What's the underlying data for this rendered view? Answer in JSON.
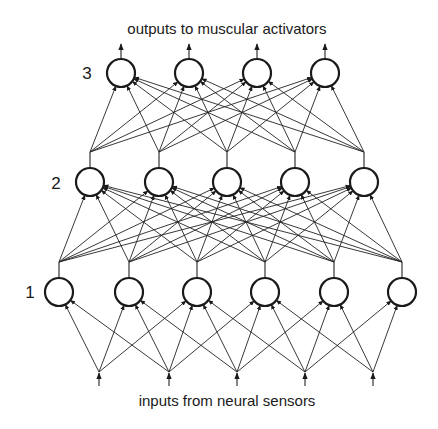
{
  "diagram": {
    "title_top": "outputs to muscular activators",
    "title_bottom": "inputs from neural sensors",
    "colors": {
      "ink": "#1a1a1a",
      "background": "#ffffff"
    },
    "layers": [
      {
        "label": "1",
        "node_count": 6
      },
      {
        "label": "2",
        "node_count": 5
      },
      {
        "label": "3",
        "node_count": 4
      }
    ],
    "inputs": {
      "count": 5,
      "connections": [
        [
          1,
          2,
          3
        ],
        [
          1,
          2,
          3,
          4
        ],
        [
          2,
          3,
          4,
          5
        ],
        [
          3,
          4,
          5,
          6
        ],
        [
          4,
          5,
          6
        ]
      ]
    },
    "connectivity": {
      "layer1_to_layer2": "full",
      "layer2_to_layer3": "full"
    },
    "outputs": {
      "count": 4
    }
  }
}
